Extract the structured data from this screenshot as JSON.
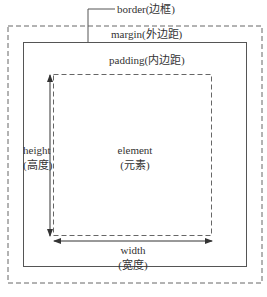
{
  "diagram": {
    "labels": {
      "border": "border(边框)",
      "margin": "margin(外边距)",
      "padding": "padding(内边距)",
      "element_line1": "element",
      "element_line2": "(元素)",
      "height_line1": "height",
      "height_line2": "(高度)",
      "width_line1": "width",
      "width_line2": "(宽度)"
    },
    "colors": {
      "stroke": "#555555",
      "text": "#333333",
      "background": "#ffffff"
    }
  }
}
